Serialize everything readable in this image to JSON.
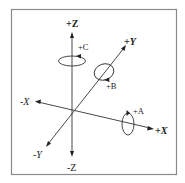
{
  "diagram": {
    "type": "3d-coordinate-axes",
    "axes": {
      "pos_z": "+Z",
      "neg_z": "-Z",
      "pos_y": "+Y",
      "neg_y": "-Y",
      "pos_x": "+X",
      "neg_x": "-X"
    },
    "rotations": {
      "a": "+A",
      "b": "+B",
      "c": "+C"
    },
    "colors": {
      "stroke": "#333333",
      "border": "#8a8a8a",
      "background": "#ffffff"
    }
  }
}
